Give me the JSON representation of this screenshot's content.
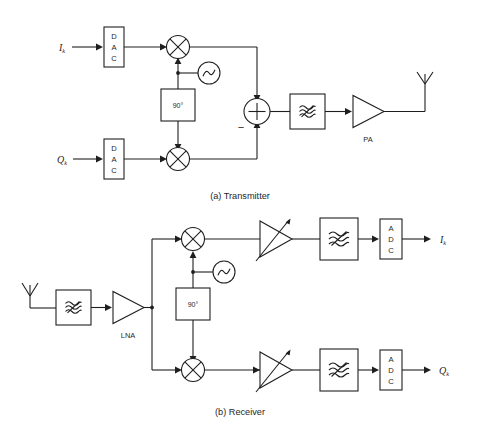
{
  "figure": {
    "background_color": "#ffffff",
    "line_color": "#1f1f1f"
  },
  "transmitter": {
    "caption": "(a) Transmitter",
    "inputs": [
      {
        "label": "I",
        "subscript": "k",
        "name": "in-phase-input"
      },
      {
        "label": "Q",
        "subscript": "k",
        "name": "quadrature-input"
      }
    ],
    "blocks": {
      "dac_i": {
        "letters": [
          "D",
          "A",
          "C"
        ],
        "name": "dac-i"
      },
      "dac_q": {
        "letters": [
          "D",
          "A",
          "C"
        ],
        "name": "dac-q"
      },
      "mixer_i": {
        "symbol": "multiply",
        "name": "mixer-i"
      },
      "mixer_q": {
        "symbol": "multiply",
        "name": "mixer-q"
      },
      "oscillator": {
        "symbol": "sine",
        "name": "local-oscillator"
      },
      "phase_shifter": {
        "label": "90°",
        "name": "phase-shifter-90"
      },
      "summer": {
        "plus": "+",
        "minus": "−",
        "name": "summing-junction"
      },
      "filter": {
        "symbol": "bandpass",
        "name": "bandpass-filter"
      },
      "amplifier": {
        "label": "PA",
        "name": "power-amplifier"
      },
      "antenna": {
        "symbol": "antenna",
        "name": "transmit-antenna"
      }
    }
  },
  "receiver": {
    "caption": "(b) Receiver",
    "outputs": [
      {
        "label": "I",
        "subscript": "k",
        "name": "in-phase-output"
      },
      {
        "label": "Q",
        "subscript": "k",
        "name": "quadrature-output"
      }
    ],
    "blocks": {
      "antenna": {
        "symbol": "antenna",
        "name": "receive-antenna"
      },
      "filter_rf": {
        "symbol": "bandpass",
        "name": "rf-bandpass-filter"
      },
      "amplifier": {
        "label": "LNA",
        "name": "low-noise-amplifier"
      },
      "mixer_i": {
        "symbol": "multiply",
        "name": "mixer-i"
      },
      "mixer_q": {
        "symbol": "multiply",
        "name": "mixer-q"
      },
      "oscillator": {
        "symbol": "sine",
        "name": "local-oscillator"
      },
      "phase_shifter": {
        "label": "90°",
        "name": "phase-shifter-90"
      },
      "vga_i": {
        "symbol": "variable-gain",
        "name": "variable-gain-amplifier-i"
      },
      "vga_q": {
        "symbol": "variable-gain",
        "name": "variable-gain-amplifier-q"
      },
      "filter_i": {
        "symbol": "lowpass",
        "name": "baseband-filter-i"
      },
      "filter_q": {
        "symbol": "lowpass",
        "name": "baseband-filter-q"
      },
      "adc_i": {
        "letters": [
          "A",
          "D",
          "C"
        ],
        "name": "adc-i"
      },
      "adc_q": {
        "letters": [
          "A",
          "D",
          "C"
        ],
        "name": "adc-q"
      }
    }
  }
}
